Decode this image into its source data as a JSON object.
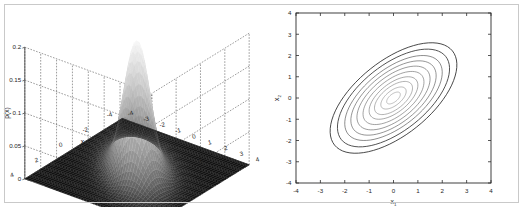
{
  "figure": {
    "background_color": "#ffffff",
    "frame_color": "#c9c9c9",
    "panel_count": 2
  },
  "left_panel": {
    "name": "gaussian-surface-3d",
    "z_axis": {
      "label": "p(x)",
      "ticks": [
        "0",
        "0.05",
        "0.1",
        "0.15",
        "0.2"
      ],
      "values": [
        0,
        0.05,
        0.1,
        0.15,
        0.2
      ]
    },
    "x1_axis": {
      "label": "x",
      "sub": "1",
      "ticks": [
        "-4",
        "-3",
        "-2",
        "-1",
        "0",
        "1",
        "2",
        "3",
        "4"
      ],
      "values": [
        -4,
        -3,
        -2,
        -1,
        0,
        1,
        2,
        3,
        4
      ]
    },
    "x2_axis": {
      "label": "x",
      "sub": "2",
      "ticks": [
        "4",
        "2",
        "0",
        "-2",
        "-4"
      ],
      "values": [
        4,
        2,
        0,
        -2,
        -4
      ]
    },
    "grid": "dashed",
    "colormap": "gray"
  },
  "right_panel": {
    "name": "gaussian-contour-2d",
    "x_axis": {
      "label": "x",
      "sub": "1",
      "ticks": [
        "-4",
        "-3",
        "-2",
        "-1",
        "0",
        "1",
        "2",
        "3",
        "4"
      ],
      "values": [
        -4,
        -3,
        -2,
        -1,
        0,
        1,
        2,
        3,
        4
      ],
      "range": [
        -4,
        4
      ]
    },
    "y_axis": {
      "label": "x",
      "sub": "2",
      "ticks": [
        "-4",
        "-3",
        "-2",
        "-1",
        "0",
        "1",
        "2",
        "3",
        "4"
      ],
      "values": [
        -4,
        -3,
        -2,
        -1,
        0,
        1,
        2,
        3,
        4
      ],
      "range": [
        -4,
        4
      ]
    },
    "grid": "off",
    "contour_count": 10
  },
  "chart_data": [
    {
      "type": "surface",
      "title": "",
      "xlabel": "x1",
      "ylabel": "x2",
      "zlabel": "p(x)",
      "xlim": [
        -4,
        4
      ],
      "ylim": [
        -4,
        4
      ],
      "zlim": [
        0,
        0.2
      ],
      "xticks": [
        -4,
        -3,
        -2,
        -1,
        0,
        1,
        2,
        3,
        4
      ],
      "yticks": [
        -4,
        -2,
        0,
        2,
        4
      ],
      "zticks": [
        0,
        0.05,
        0.1,
        0.15,
        0.2
      ],
      "grid": true,
      "colormap": "gray",
      "function": "bivariate gaussian pdf",
      "mean": [
        0,
        0
      ],
      "covariance": [
        [
          1.0,
          0.6
        ],
        [
          0.6,
          1.0
        ]
      ],
      "peak_value": 0.199,
      "peak_location": [
        0,
        0
      ],
      "view_azimuth": -37.5,
      "view_elevation": 30
    },
    {
      "type": "contour",
      "title": "",
      "xlabel": "x1",
      "ylabel": "x2",
      "xlim": [
        -4,
        4
      ],
      "ylim": [
        -4,
        4
      ],
      "xticks": [
        -4,
        -3,
        -2,
        -1,
        0,
        1,
        2,
        3,
        4
      ],
      "yticks": [
        -4,
        -3,
        -2,
        -1,
        0,
        1,
        2,
        3,
        4
      ],
      "grid": false,
      "legend": "none",
      "mean": [
        0,
        0
      ],
      "covariance": [
        [
          1.0,
          0.6
        ],
        [
          0.6,
          1.0
        ]
      ],
      "orientation_deg": 45,
      "levels": [
        0.02,
        0.04,
        0.06,
        0.08,
        0.1,
        0.12,
        0.14,
        0.16,
        0.18,
        0.19
      ],
      "contour_radii_sigma": [
        2.6,
        2.3,
        2.0,
        1.75,
        1.5,
        1.25,
        1.0,
        0.78,
        0.52,
        0.28
      ]
    }
  ]
}
